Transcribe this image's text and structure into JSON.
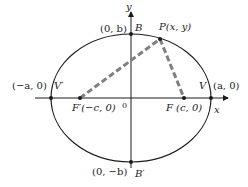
{
  "diagram": {
    "type": "ellipse-with-foci",
    "colors": {
      "curve": "#1a1a1a",
      "axes": "#1a1a1a",
      "focal_segments": "#808080",
      "text": "#222222"
    },
    "axes": {
      "x_label": "x",
      "y_label": "y",
      "origin_label": "0"
    },
    "points": {
      "V_prime": {
        "name": "V′",
        "coord": "(−a, 0)"
      },
      "V": {
        "name": "V",
        "coord": "(a, 0)"
      },
      "B": {
        "name": "B",
        "coord": "(0, b)"
      },
      "B_prime": {
        "name": "B′",
        "coord": "(0, −b)"
      },
      "F_prime": {
        "label": "F′(−c, 0)"
      },
      "F": {
        "label": "F (c, 0)"
      },
      "P": {
        "label": "P(x, y)"
      }
    }
  }
}
